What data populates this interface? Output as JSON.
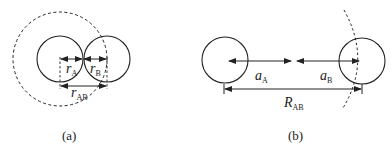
{
  "panels": {
    "a": {
      "caption": "(a)",
      "label_rA": {
        "main": "r",
        "sub": "A"
      },
      "label_rB": {
        "main": "r",
        "sub": "B"
      },
      "label_rAB": {
        "main": "r",
        "sub": "AB"
      }
    },
    "b": {
      "caption": "(b)",
      "label_aA": {
        "main": "a",
        "sub": "A"
      },
      "label_aB": {
        "main": "a",
        "sub": "B"
      },
      "label_RAB": {
        "main": "R",
        "sub": "AB"
      }
    }
  },
  "colors": {
    "stroke": "#222222",
    "background": "#ffffff"
  }
}
